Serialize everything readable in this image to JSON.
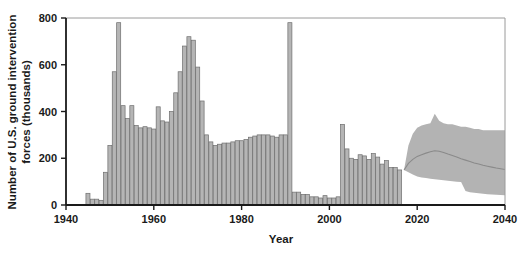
{
  "chart_data": {
    "type": "bar",
    "title": "",
    "xlabel": "Year",
    "ylabel": "Number of U.S. ground intervention forces (thousands)",
    "xlim": [
      1940,
      2040
    ],
    "ylim": [
      0,
      800
    ],
    "xticks": [
      1940,
      1960,
      1980,
      2000,
      2020,
      2040
    ],
    "yticks": [
      0,
      200,
      400,
      600,
      800
    ],
    "grid": false,
    "legend": null,
    "series": [
      {
        "name": "Historical U.S. ground intervention forces",
        "type": "bar",
        "colors": {
          "fill": "#b5b5b5",
          "stroke": "#6e6e6e"
        },
        "x": [
          1945,
          1946,
          1947,
          1948,
          1949,
          1950,
          1951,
          1952,
          1953,
          1954,
          1955,
          1956,
          1957,
          1958,
          1959,
          1960,
          1961,
          1962,
          1963,
          1964,
          1965,
          1966,
          1967,
          1968,
          1969,
          1970,
          1971,
          1972,
          1973,
          1974,
          1975,
          1976,
          1977,
          1978,
          1979,
          1980,
          1981,
          1982,
          1983,
          1984,
          1985,
          1986,
          1987,
          1988,
          1989,
          1990,
          1991,
          1992,
          1993,
          1994,
          1995,
          1996,
          1997,
          1998,
          1999,
          2000,
          2001,
          2002,
          2003,
          2004,
          2005,
          2006,
          2007,
          2008,
          2009,
          2010,
          2011,
          2012,
          2013,
          2014,
          2015,
          2016
        ],
        "values": [
          50,
          25,
          25,
          20,
          140,
          255,
          570,
          780,
          425,
          370,
          425,
          340,
          330,
          335,
          330,
          325,
          420,
          360,
          355,
          400,
          480,
          570,
          680,
          720,
          705,
          590,
          445,
          300,
          270,
          255,
          260,
          265,
          265,
          270,
          275,
          275,
          280,
          290,
          295,
          300,
          300,
          300,
          295,
          290,
          300,
          300,
          780,
          55,
          55,
          45,
          45,
          35,
          35,
          30,
          40,
          30,
          30,
          35,
          345,
          240,
          200,
          195,
          215,
          210,
          195,
          220,
          205,
          175,
          190,
          160,
          160,
          150
        ]
      },
      {
        "name": "Projected range (uncertainty band)",
        "type": "band",
        "colors": {
          "fill": "#b3b3b3"
        },
        "x": [
          2017,
          2018,
          2019,
          2020,
          2021,
          2022,
          2023,
          2024,
          2025,
          2026,
          2027,
          2028,
          2029,
          2030,
          2031,
          2032,
          2033,
          2034,
          2035,
          2036,
          2037,
          2038,
          2039,
          2040
        ],
        "upper": [
          150,
          255,
          305,
          330,
          340,
          345,
          350,
          390,
          360,
          350,
          345,
          345,
          340,
          335,
          335,
          330,
          325,
          325,
          320,
          320,
          320,
          320,
          320,
          320
        ],
        "lower": [
          150,
          140,
          130,
          122,
          118,
          115,
          112,
          110,
          108,
          106,
          104,
          102,
          100,
          98,
          60,
          55,
          52,
          50,
          48,
          46,
          45,
          44,
          43,
          42
        ]
      },
      {
        "name": "Projected median",
        "type": "line",
        "colors": {
          "stroke": "#8a8a8a"
        },
        "x": [
          2017,
          2018,
          2019,
          2020,
          2021,
          2022,
          2023,
          2024,
          2025,
          2026,
          2027,
          2028,
          2029,
          2030,
          2031,
          2032,
          2033,
          2034,
          2035,
          2036,
          2037,
          2038,
          2039,
          2040
        ],
        "values": [
          150,
          178,
          195,
          208,
          215,
          222,
          228,
          232,
          230,
          225,
          218,
          212,
          205,
          198,
          192,
          186,
          180,
          175,
          170,
          166,
          162,
          158,
          155,
          152
        ]
      }
    ]
  },
  "axes": {
    "x_title": "Year",
    "y_title_line1": "Number of U.S. ground intervention",
    "y_title_line2": "forces (thousands)",
    "x_tick_labels": [
      "1940",
      "1960",
      "1980",
      "2000",
      "2020",
      "2040"
    ],
    "y_tick_labels": [
      "0",
      "200",
      "400",
      "600",
      "800"
    ]
  },
  "colors": {
    "bar_fill": "#b5b5b5",
    "bar_stroke": "#6e6e6e",
    "band_fill": "#b3b3b3",
    "median_stroke": "#8a8a8a",
    "axis": "#1a1a1a",
    "frame": "#9a9a9a",
    "background": "#ffffff"
  }
}
